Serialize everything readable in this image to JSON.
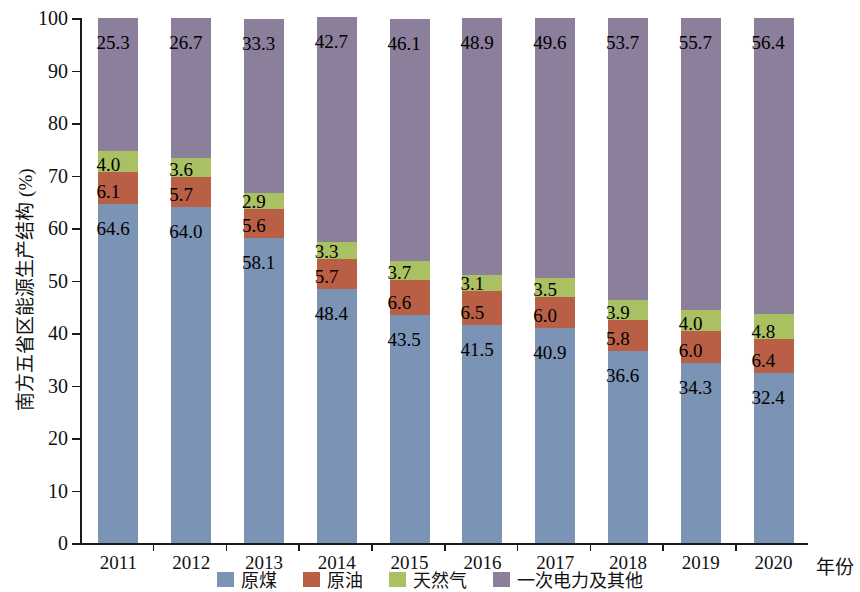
{
  "chart_data": {
    "type": "bar",
    "subtype": "stacked-100-percent",
    "title": "",
    "xlabel": "年份",
    "ylabel": "南方五省区能源生产结构 (%)",
    "categories": [
      "2011",
      "2012",
      "2013",
      "2014",
      "2015",
      "2016",
      "2017",
      "2018",
      "2019",
      "2020"
    ],
    "ylim": [
      0,
      100
    ],
    "yticks": [
      0,
      10,
      20,
      30,
      40,
      50,
      60,
      70,
      80,
      90,
      100
    ],
    "grid": false,
    "legend_position": "bottom-center",
    "series": [
      {
        "name": "原煤",
        "color": "#7b93b5",
        "values": [
          64.6,
          64.0,
          58.1,
          48.4,
          43.5,
          41.5,
          40.9,
          36.6,
          34.3,
          32.4
        ]
      },
      {
        "name": "原油",
        "color": "#b85f45",
        "values": [
          6.1,
          5.7,
          5.6,
          5.7,
          6.6,
          6.5,
          6.0,
          5.8,
          6.0,
          6.4
        ]
      },
      {
        "name": "天然气",
        "color": "#a9c162",
        "values": [
          4.0,
          3.6,
          2.9,
          3.3,
          3.7,
          3.1,
          3.5,
          3.9,
          4.0,
          4.8
        ]
      },
      {
        "name": "一次电力及其他",
        "color": "#8c7f9c",
        "values": [
          25.3,
          26.7,
          33.3,
          42.7,
          46.1,
          48.9,
          49.6,
          53.7,
          55.7,
          56.4
        ]
      }
    ]
  },
  "axis": {
    "y_tick_labels": [
      "0",
      "10",
      "20",
      "30",
      "40",
      "50",
      "60",
      "70",
      "80",
      "90",
      "100"
    ],
    "x_tick_labels": [
      "2011",
      "2012",
      "2013",
      "2014",
      "2015",
      "2016",
      "2017",
      "2018",
      "2019",
      "2020"
    ],
    "y_title": "南方五省区能源生产结构 (%)",
    "x_title": "年份"
  },
  "legend": {
    "items": [
      {
        "label": "原煤",
        "color": "#7b93b5"
      },
      {
        "label": "原油",
        "color": "#b85f45"
      },
      {
        "label": "天然气",
        "color": "#a9c162"
      },
      {
        "label": "一次电力及其他",
        "color": "#8c7f9c"
      }
    ]
  }
}
